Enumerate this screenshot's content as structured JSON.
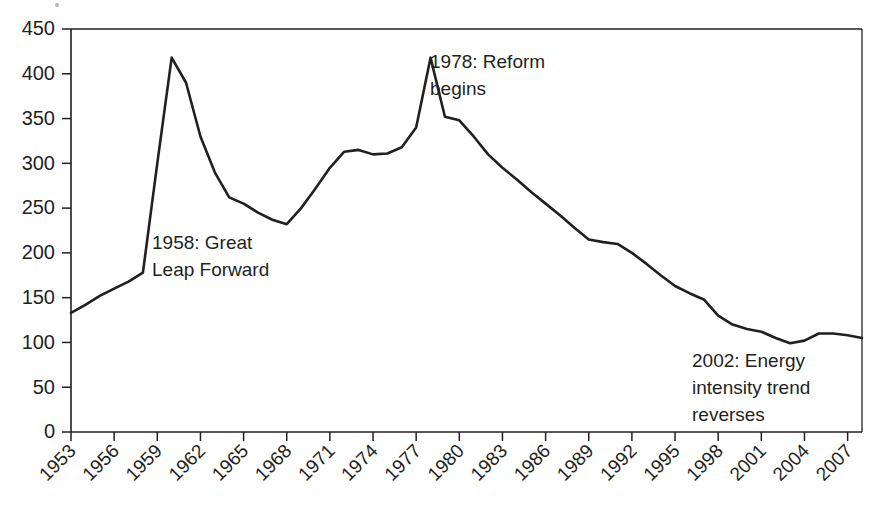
{
  "chart_data": {
    "type": "line",
    "title": "",
    "subtitle": "",
    "xlabel": "",
    "ylabel": "",
    "xlim": [
      1953,
      2008
    ],
    "ylim": [
      0,
      450
    ],
    "grid": false,
    "legend": false,
    "legend_position": "none",
    "line_color": "#231f20",
    "x_tick_labels": [
      "1953",
      "1956",
      "1959",
      "1962",
      "1965",
      "1968",
      "1971",
      "1974",
      "1977",
      "1980",
      "1983",
      "1986",
      "1989",
      "1992",
      "1995",
      "1998",
      "2001",
      "2004",
      "2007"
    ],
    "x_tick_values": [
      1953,
      1956,
      1959,
      1962,
      1965,
      1968,
      1971,
      1974,
      1977,
      1980,
      1983,
      1986,
      1989,
      1992,
      1995,
      1998,
      2001,
      2004,
      2007
    ],
    "y_tick_labels": [
      "0",
      "50",
      "100",
      "150",
      "200",
      "250",
      "300",
      "350",
      "400",
      "450"
    ],
    "y_tick_values": [
      0,
      50,
      100,
      150,
      200,
      250,
      300,
      350,
      400,
      450
    ],
    "series": [
      {
        "name": "Energy intensity",
        "x": [
          1953,
          1954,
          1955,
          1956,
          1957,
          1958,
          1959,
          1960,
          1961,
          1962,
          1963,
          1964,
          1965,
          1966,
          1967,
          1968,
          1969,
          1970,
          1971,
          1972,
          1973,
          1974,
          1975,
          1976,
          1977,
          1978,
          1979,
          1980,
          1981,
          1982,
          1983,
          1984,
          1985,
          1986,
          1987,
          1988,
          1989,
          1990,
          1991,
          1992,
          1993,
          1994,
          1995,
          1996,
          1997,
          1998,
          1999,
          2000,
          2001,
          2002,
          2003,
          2004,
          2005,
          2006,
          2007,
          2008
        ],
        "values": [
          133,
          142,
          152,
          160,
          168,
          178,
          300,
          418,
          390,
          330,
          290,
          262,
          255,
          245,
          237,
          232,
          250,
          272,
          295,
          313,
          315,
          310,
          311,
          318,
          340,
          418,
          352,
          348,
          330,
          310,
          295,
          282,
          268,
          255,
          242,
          228,
          215,
          212,
          210,
          200,
          188,
          175,
          163,
          155,
          148,
          130,
          120,
          115,
          112,
          105,
          99,
          102,
          110,
          110,
          108,
          105
        ]
      }
    ],
    "annotations": [
      {
        "id": "great-leap-forward",
        "text_lines": [
          "1958: Great",
          "Leap Forward"
        ],
        "x_px": 152,
        "y_px": 249
      },
      {
        "id": "reform-begins",
        "text_lines": [
          "1978: Reform",
          "begins"
        ],
        "x_px": 430,
        "y_px": 68
      },
      {
        "id": "energy-intensity-reverses",
        "text_lines": [
          "2002: Energy",
          "intensity trend",
          "reverses"
        ],
        "x_px": 692,
        "y_px": 367
      }
    ]
  },
  "plot_geometry": {
    "left_px": 71,
    "right_px": 862,
    "top_px": 29,
    "bottom_px": 432
  }
}
